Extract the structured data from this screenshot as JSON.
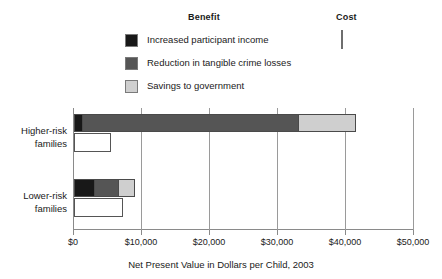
{
  "legend": {
    "headings": [
      {
        "name": "benefit",
        "label": "Benefit"
      },
      {
        "name": "cost",
        "label": "Cost"
      }
    ],
    "items": [
      {
        "key": "income",
        "label": "Increased participant income",
        "color": "#181818"
      },
      {
        "key": "crime",
        "label": "Reduction in tangible crime losses",
        "color": "#555555"
      },
      {
        "key": "savings",
        "label": "Savings to government",
        "color": "#cfcfcf"
      }
    ],
    "cost_item": {
      "key": "cost",
      "label": "Cost",
      "color": "#ffffff"
    }
  },
  "chart_data": {
    "type": "bar",
    "orientation": "horizontal",
    "title": "",
    "xlabel": "Net Present Value in Dollars per Child, 2003",
    "ylabel": "",
    "xlim": [
      0,
      50000
    ],
    "xticks": [
      0,
      10000,
      20000,
      30000,
      40000,
      50000
    ],
    "xtick_labels": [
      "$0",
      "$10,000",
      "$20,000",
      "$30,000",
      "$40,000",
      "$50,000"
    ],
    "grid": true,
    "grid_axis": "x",
    "legend_position": "top",
    "categories": [
      "Higher-risk families",
      "Lower-risk families"
    ],
    "category_labels": [
      {
        "line1": "Higher-risk",
        "line2": "families"
      },
      {
        "line1": "Lower-risk",
        "line2": "families"
      }
    ],
    "series": [
      {
        "name": "Increased participant income",
        "group": "Benefit",
        "color": "#181818",
        "values": [
          1300,
          3100
        ]
      },
      {
        "name": "Reduction in tangible crime losses",
        "group": "Benefit",
        "color": "#555555",
        "values": [
          31900,
          3700
        ]
      },
      {
        "name": "Savings to government",
        "group": "Benefit",
        "color": "#cfcfcf",
        "values": [
          8600,
          2500
        ]
      },
      {
        "name": "Cost",
        "group": "Cost",
        "color": "#ffffff",
        "values": [
          5400,
          7200
        ]
      }
    ],
    "benefit_totals": [
      41800,
      9300
    ],
    "cost_totals": [
      5400,
      7200
    ]
  }
}
